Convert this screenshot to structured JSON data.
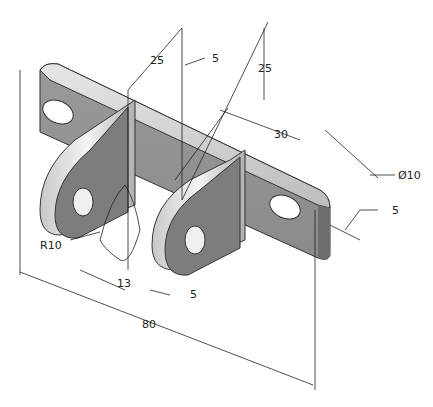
{
  "drawing": {
    "title": "Isometric bracket with dimensions",
    "dimensions": {
      "top_left_25": "25",
      "top_5": "5",
      "top_right_25": "25",
      "right_30": "30",
      "hole_diameter": "Ø10",
      "right_5": "5",
      "radius": "R10",
      "bottom_13": "13",
      "bottom_5": "5",
      "overall_80": "80"
    },
    "colors": {
      "face_light": "#d8d8d8",
      "face_mid": "#a8a8a8",
      "face_dark": "#7a7a7a",
      "line": "#222222"
    }
  }
}
